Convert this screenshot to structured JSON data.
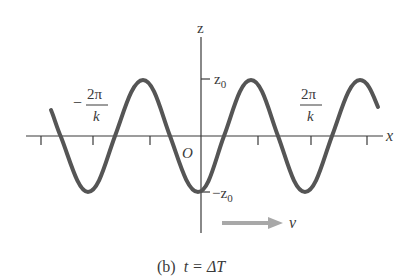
{
  "diagram": {
    "type": "sinusoidal-wave",
    "axes": {
      "x_label": "x",
      "z_label": "z",
      "origin_label": "O",
      "z_max_label": "z",
      "z_max_sub": "0",
      "z_min_label": "−z",
      "z_min_sub": "0"
    },
    "annotations": {
      "neg_wavelength_sign": "−",
      "neg_wavelength_num": "2π",
      "neg_wavelength_den": "k",
      "pos_wavelength_num": "2π",
      "pos_wavelength_den": "k",
      "velocity_label": "v"
    },
    "caption": {
      "part": "(b)",
      "text": "t = ΔT"
    },
    "colors": {
      "wave": "#555555",
      "axes": "#3a3a3a",
      "arrow": "#a8a8a8"
    }
  }
}
